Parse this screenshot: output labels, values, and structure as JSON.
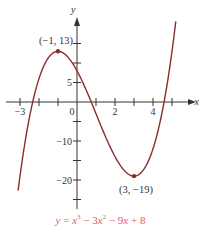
{
  "chart_data": {
    "type": "line",
    "title": "",
    "equation": "y = x³ − 3x² − 9x + 8",
    "xlabel": "x",
    "ylabel": "y",
    "xlim": [
      -3.4,
      6.2
    ],
    "ylim": [
      -27,
      21
    ],
    "x_ticks": [
      -3,
      -2,
      -1,
      0,
      1,
      2,
      3,
      4,
      5
    ],
    "x_tick_labels": [
      {
        "value": -3,
        "label": "−3"
      },
      {
        "value": 0,
        "label": "0"
      },
      {
        "value": 2,
        "label": "2"
      },
      {
        "value": 4,
        "label": "4"
      }
    ],
    "y_ticks": [
      -25,
      -20,
      -15,
      -10,
      -5,
      5,
      10,
      15
    ],
    "y_tick_labels": [
      {
        "value": 5,
        "label": "5"
      },
      {
        "value": -10,
        "label": "−10"
      },
      {
        "value": -20,
        "label": "−20"
      }
    ],
    "series": [
      {
        "name": "y = x^3 - 3x^2 - 9x + 8",
        "coefficients": [
          1,
          -3,
          -9,
          8
        ],
        "x_range": [
          -3.1,
          5.2
        ],
        "color": "#8b2b2b"
      }
    ],
    "points": [
      {
        "x": -1,
        "y": 13,
        "label": "(−1, 13)"
      },
      {
        "x": 3,
        "y": -19,
        "label": "(3, −19)"
      }
    ],
    "grid": false
  },
  "caption": {
    "y": "y",
    "eq": "=",
    "x1": "x",
    "sup1": "3",
    "minus1": "−",
    "c2": "3",
    "x2": "x",
    "sup2": "2",
    "minus2": "−",
    "c3": "9",
    "x3": "x",
    "plus": "+",
    "c4": "8"
  },
  "colors": {
    "curve": "#8b2b2b",
    "caption": "#e05c5c",
    "axis": "#333333"
  }
}
